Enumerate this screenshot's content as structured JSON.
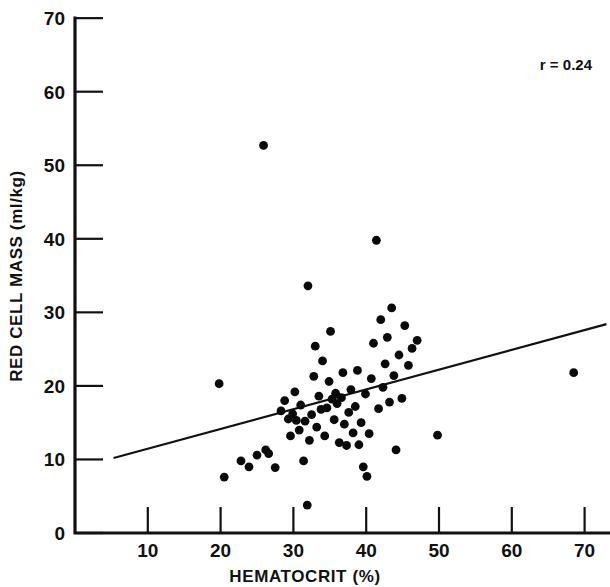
{
  "chart_data": {
    "type": "scatter",
    "title": "",
    "xlabel": "HEMATOCRIT (%)",
    "ylabel": "RED CELL MASS (ml/kg)",
    "xlim": [
      0,
      75
    ],
    "ylim": [
      0,
      70
    ],
    "xticks": [
      10,
      20,
      30,
      40,
      50,
      60,
      70
    ],
    "yticks": [
      0,
      10,
      20,
      30,
      40,
      50,
      60,
      70
    ],
    "grid": false,
    "legend": null,
    "annotations": [
      {
        "name": "correlation",
        "text": "r = 0.24",
        "x": 62,
        "y": 65
      }
    ],
    "trendline": {
      "name": "regression-line",
      "x_start": 5.3,
      "y_start": 10.2,
      "x_end": 73.0,
      "y_end": 28.4
    },
    "points": [
      {
        "x": 19.8,
        "y": 20.3
      },
      {
        "x": 20.5,
        "y": 7.6
      },
      {
        "x": 22.8,
        "y": 9.8
      },
      {
        "x": 23.9,
        "y": 9.0
      },
      {
        "x": 25.0,
        "y": 10.6
      },
      {
        "x": 25.9,
        "y": 52.7
      },
      {
        "x": 26.2,
        "y": 11.3
      },
      {
        "x": 26.6,
        "y": 10.8
      },
      {
        "x": 27.5,
        "y": 8.9
      },
      {
        "x": 28.3,
        "y": 16.6
      },
      {
        "x": 28.8,
        "y": 18.0
      },
      {
        "x": 29.3,
        "y": 15.5
      },
      {
        "x": 29.6,
        "y": 13.2
      },
      {
        "x": 29.9,
        "y": 16.2
      },
      {
        "x": 30.2,
        "y": 19.2
      },
      {
        "x": 30.4,
        "y": 15.3
      },
      {
        "x": 30.8,
        "y": 14.0
      },
      {
        "x": 31.0,
        "y": 17.4
      },
      {
        "x": 31.4,
        "y": 9.8
      },
      {
        "x": 31.6,
        "y": 15.2
      },
      {
        "x": 31.9,
        "y": 3.8
      },
      {
        "x": 32.0,
        "y": 33.6
      },
      {
        "x": 32.2,
        "y": 12.6
      },
      {
        "x": 32.5,
        "y": 16.1
      },
      {
        "x": 32.8,
        "y": 21.3
      },
      {
        "x": 33.0,
        "y": 25.4
      },
      {
        "x": 33.2,
        "y": 14.4
      },
      {
        "x": 33.5,
        "y": 18.6
      },
      {
        "x": 33.8,
        "y": 16.8
      },
      {
        "x": 34.0,
        "y": 23.4
      },
      {
        "x": 34.3,
        "y": 13.2
      },
      {
        "x": 34.6,
        "y": 17.0
      },
      {
        "x": 34.9,
        "y": 20.6
      },
      {
        "x": 35.1,
        "y": 27.4
      },
      {
        "x": 35.3,
        "y": 18.2
      },
      {
        "x": 35.6,
        "y": 15.4
      },
      {
        "x": 35.8,
        "y": 19.0
      },
      {
        "x": 36.0,
        "y": 17.6
      },
      {
        "x": 36.3,
        "y": 12.3
      },
      {
        "x": 36.6,
        "y": 18.4
      },
      {
        "x": 36.8,
        "y": 21.8
      },
      {
        "x": 37.0,
        "y": 14.8
      },
      {
        "x": 37.3,
        "y": 11.9
      },
      {
        "x": 37.6,
        "y": 16.4
      },
      {
        "x": 37.9,
        "y": 19.5
      },
      {
        "x": 38.2,
        "y": 13.6
      },
      {
        "x": 38.5,
        "y": 17.2
      },
      {
        "x": 38.8,
        "y": 22.1
      },
      {
        "x": 39.0,
        "y": 12.0
      },
      {
        "x": 39.3,
        "y": 15.0
      },
      {
        "x": 39.6,
        "y": 9.0
      },
      {
        "x": 39.9,
        "y": 18.9
      },
      {
        "x": 40.1,
        "y": 7.7
      },
      {
        "x": 40.4,
        "y": 13.5
      },
      {
        "x": 40.7,
        "y": 21.0
      },
      {
        "x": 41.0,
        "y": 25.8
      },
      {
        "x": 41.4,
        "y": 39.8
      },
      {
        "x": 41.7,
        "y": 16.9
      },
      {
        "x": 42.0,
        "y": 29.0
      },
      {
        "x": 42.3,
        "y": 19.8
      },
      {
        "x": 42.6,
        "y": 23.0
      },
      {
        "x": 42.9,
        "y": 26.6
      },
      {
        "x": 43.2,
        "y": 17.8
      },
      {
        "x": 43.5,
        "y": 30.6
      },
      {
        "x": 43.8,
        "y": 21.4
      },
      {
        "x": 44.1,
        "y": 11.3
      },
      {
        "x": 44.5,
        "y": 24.2
      },
      {
        "x": 44.9,
        "y": 18.3
      },
      {
        "x": 45.3,
        "y": 28.2
      },
      {
        "x": 45.8,
        "y": 22.8
      },
      {
        "x": 46.3,
        "y": 25.1
      },
      {
        "x": 47.0,
        "y": 26.2
      },
      {
        "x": 49.8,
        "y": 13.3
      },
      {
        "x": 68.5,
        "y": 21.8
      }
    ]
  }
}
